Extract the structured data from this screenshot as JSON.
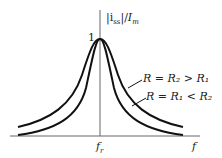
{
  "diagram": {
    "type": "resonance-curves",
    "y_axis_label": "|i_ss|/I_m",
    "y_axis_label_parts": {
      "a": "|i",
      "sub": "ss",
      "b": "|/",
      "c": "I",
      "csub": "m"
    },
    "x_axis_label": "f",
    "peak_tick_label": "1",
    "resonance_label": {
      "main": "f",
      "sub": "r"
    },
    "curves": [
      {
        "name": "wide",
        "label": "R = R₂ > R₁"
      },
      {
        "name": "narrow",
        "label": "R = R₁ < R₂"
      }
    ],
    "colors": {
      "line": "#111111",
      "axis": "#555555"
    }
  }
}
